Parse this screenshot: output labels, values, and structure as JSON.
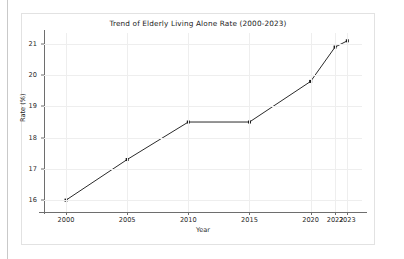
{
  "chart_data": {
    "type": "line",
    "title": "Trend of Elderly Living Alone Rate (2000-2023)",
    "xlabel": "Year",
    "ylabel": "Rate (%)",
    "x": [
      2000,
      2005,
      2010,
      2015,
      2020,
      2022,
      2023
    ],
    "values": [
      16.0,
      17.3,
      18.5,
      18.5,
      19.8,
      20.9,
      21.1
    ],
    "series": [
      {
        "name": "Elderly Living Alone Rate",
        "values": [
          16.0,
          17.3,
          18.5,
          18.5,
          19.8,
          20.9,
          21.1
        ]
      }
    ],
    "xtick_labels": [
      "2000",
      "2005",
      "2010",
      "2015",
      "2020",
      "2022",
      "2023"
    ],
    "xtick_values": [
      2000,
      2005,
      2010,
      2015,
      2020,
      2022,
      2023
    ],
    "ytick_labels": [
      "16",
      "17",
      "18",
      "19",
      "20",
      "21"
    ],
    "ytick_values": [
      16,
      17,
      18,
      19,
      20,
      21
    ],
    "xlim": [
      1998.2,
      2024.2
    ],
    "ylim": [
      15.62,
      21.35
    ],
    "grid": true,
    "legend": false,
    "line_color": "#2b2b2b",
    "marker": "square",
    "marker_color": "#1a1a1a",
    "grid_color": "#eeeeee",
    "background_color": "#ffffff"
  }
}
